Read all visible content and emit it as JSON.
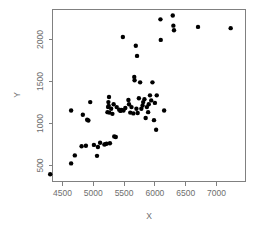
{
  "chart_data": {
    "type": "scatter",
    "title": "",
    "subtitle": "",
    "xlabel": "X",
    "ylabel": "Y",
    "xlim": [
      4250,
      7300
    ],
    "ylim": [
      350,
      2300
    ],
    "xticks": [
      4500,
      5000,
      5500,
      6000,
      6500,
      7000
    ],
    "yticks": [
      500,
      1000,
      1500,
      2000
    ],
    "xticklabels": [
      "4500",
      "5000",
      "5500",
      "6000",
      "6500",
      "7000"
    ],
    "yticklabels": [
      "500",
      "1000",
      "1500",
      "2000"
    ],
    "grid": false,
    "legend": null,
    "marker": "filled-circle",
    "marker_color": "#000000",
    "marker_size": 2.2,
    "n_points": 72,
    "points": [
      {
        "x": 4300,
        "y": 395
      },
      {
        "x": 4640,
        "y": 525
      },
      {
        "x": 4640,
        "y": 1155
      },
      {
        "x": 4700,
        "y": 620
      },
      {
        "x": 4810,
        "y": 730
      },
      {
        "x": 4830,
        "y": 1105
      },
      {
        "x": 4880,
        "y": 735
      },
      {
        "x": 4900,
        "y": 1045
      },
      {
        "x": 4920,
        "y": 1035
      },
      {
        "x": 4950,
        "y": 1255
      },
      {
        "x": 5010,
        "y": 745
      },
      {
        "x": 5060,
        "y": 615
      },
      {
        "x": 5075,
        "y": 720
      },
      {
        "x": 5110,
        "y": 770
      },
      {
        "x": 5180,
        "y": 750
      },
      {
        "x": 5200,
        "y": 755
      },
      {
        "x": 5215,
        "y": 760
      },
      {
        "x": 5230,
        "y": 1135
      },
      {
        "x": 5240,
        "y": 1195
      },
      {
        "x": 5245,
        "y": 1255
      },
      {
        "x": 5250,
        "y": 1210
      },
      {
        "x": 5255,
        "y": 1315
      },
      {
        "x": 5260,
        "y": 1130
      },
      {
        "x": 5270,
        "y": 765
      },
      {
        "x": 5290,
        "y": 1175
      },
      {
        "x": 5310,
        "y": 1115
      },
      {
        "x": 5330,
        "y": 1230
      },
      {
        "x": 5340,
        "y": 845
      },
      {
        "x": 5365,
        "y": 840
      },
      {
        "x": 5380,
        "y": 1195
      },
      {
        "x": 5420,
        "y": 1165
      },
      {
        "x": 5440,
        "y": 1150
      },
      {
        "x": 5460,
        "y": 1160
      },
      {
        "x": 5480,
        "y": 2030
      },
      {
        "x": 5490,
        "y": 1155
      },
      {
        "x": 5520,
        "y": 1185
      },
      {
        "x": 5570,
        "y": 1280
      },
      {
        "x": 5580,
        "y": 1230
      },
      {
        "x": 5600,
        "y": 1130
      },
      {
        "x": 5620,
        "y": 1195
      },
      {
        "x": 5650,
        "y": 1120
      },
      {
        "x": 5665,
        "y": 1555
      },
      {
        "x": 5670,
        "y": 1515
      },
      {
        "x": 5690,
        "y": 1925
      },
      {
        "x": 5700,
        "y": 1175
      },
      {
        "x": 5710,
        "y": 1805
      },
      {
        "x": 5720,
        "y": 1125
      },
      {
        "x": 5740,
        "y": 1300
      },
      {
        "x": 5760,
        "y": 1490
      },
      {
        "x": 5780,
        "y": 1175
      },
      {
        "x": 5800,
        "y": 1215
      },
      {
        "x": 5810,
        "y": 1255
      },
      {
        "x": 5830,
        "y": 1290
      },
      {
        "x": 5850,
        "y": 1065
      },
      {
        "x": 5870,
        "y": 1195
      },
      {
        "x": 5890,
        "y": 1135
      },
      {
        "x": 5900,
        "y": 1230
      },
      {
        "x": 5920,
        "y": 1335
      },
      {
        "x": 5940,
        "y": 1275
      },
      {
        "x": 5960,
        "y": 1490
      },
      {
        "x": 5985,
        "y": 1040
      },
      {
        "x": 6000,
        "y": 1245
      },
      {
        "x": 6020,
        "y": 925
      },
      {
        "x": 6030,
        "y": 1335
      },
      {
        "x": 6090,
        "y": 2240
      },
      {
        "x": 6095,
        "y": 1995
      },
      {
        "x": 6150,
        "y": 1155
      },
      {
        "x": 6290,
        "y": 2285
      },
      {
        "x": 6300,
        "y": 2165
      },
      {
        "x": 6310,
        "y": 2110
      },
      {
        "x": 6700,
        "y": 2150
      },
      {
        "x": 7230,
        "y": 2135
      }
    ]
  },
  "figure": {
    "background": "#ffffff",
    "axis_color": "#808080",
    "text_color": "#6e6e6e",
    "point_color": "#000000"
  }
}
